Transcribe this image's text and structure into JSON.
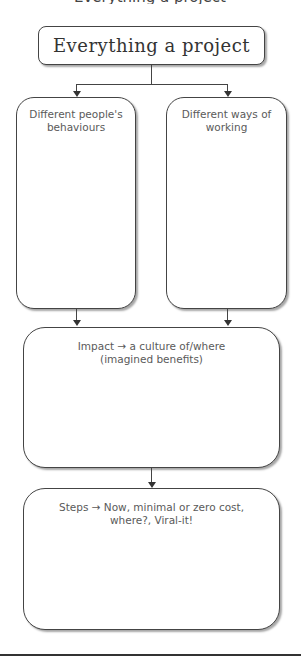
{
  "diagram": {
    "clipped_heading": "Everything a project",
    "title": "Everything a project",
    "nodes": {
      "left": "Different people's behaviours",
      "right": "Different ways of working",
      "impact": "Impact → a culture of/where (imagined benefits)",
      "steps": "Steps → Now, minimal or zero cost, where?, Viral-it!"
    },
    "edges": [
      {
        "from": "title",
        "to": "left"
      },
      {
        "from": "title",
        "to": "right"
      },
      {
        "from": "left",
        "to": "impact"
      },
      {
        "from": "right",
        "to": "impact"
      },
      {
        "from": "impact",
        "to": "steps"
      }
    ],
    "colors": {
      "stroke": "#444444",
      "text": "#5a5a5a",
      "background": "#ffffff"
    }
  }
}
